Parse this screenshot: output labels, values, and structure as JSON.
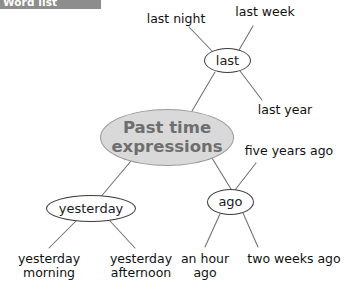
{
  "banner": {
    "title": "Word list"
  },
  "diagram": {
    "type": "mind-map",
    "topic": "Past time expressions",
    "center": {
      "id": "center",
      "label": "Past time expressions",
      "fill": "#d9d9d9",
      "text_color": "#6e6e6e",
      "stroke": "#9a9a9a"
    },
    "nodes": [
      {
        "id": "last",
        "label": "last",
        "shape": "ellipse"
      },
      {
        "id": "ago",
        "label": "ago",
        "shape": "ellipse"
      },
      {
        "id": "yesterday",
        "label": "yesterday",
        "shape": "ellipse"
      }
    ],
    "leaves": [
      {
        "id": "last-night",
        "label": "last night",
        "parent": "last"
      },
      {
        "id": "last-week",
        "label": "last week",
        "parent": "last"
      },
      {
        "id": "last-year",
        "label": "last year",
        "parent": "last"
      },
      {
        "id": "five-years-ago",
        "label": "five years ago",
        "parent": "ago"
      },
      {
        "id": "an-hour-ago",
        "label": "an hour\nago",
        "parent": "ago"
      },
      {
        "id": "two-weeks-ago",
        "label": "two weeks ago",
        "parent": "ago"
      },
      {
        "id": "yesterday-morning",
        "label": "yesterday\nmorning",
        "parent": "yesterday"
      },
      {
        "id": "yesterday-afternoon",
        "label": "yesterday\nafternoon",
        "parent": "yesterday"
      }
    ],
    "edges": [
      {
        "from": "center",
        "to": "last"
      },
      {
        "from": "center",
        "to": "ago"
      },
      {
        "from": "center",
        "to": "yesterday"
      },
      {
        "from": "last",
        "to": "last-night"
      },
      {
        "from": "last",
        "to": "last-week"
      },
      {
        "from": "last",
        "to": "last-year"
      },
      {
        "from": "ago",
        "to": "five-years-ago"
      },
      {
        "from": "ago",
        "to": "an-hour-ago"
      },
      {
        "from": "ago",
        "to": "two-weeks-ago"
      },
      {
        "from": "yesterday",
        "to": "yesterday-morning"
      },
      {
        "from": "yesterday",
        "to": "yesterday-afternoon"
      }
    ],
    "colors": {
      "line": "#6f6f6f",
      "node_stroke": "#3a3a3a",
      "text": "#111111",
      "banner_bg": "#8d8d8d"
    }
  }
}
